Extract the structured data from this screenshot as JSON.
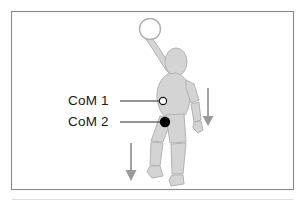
{
  "figure": {
    "background_color": "#ffffff",
    "border_color": "#8a8a8a",
    "body_fill": "#d4d4d4",
    "body_stroke": "#b3b3b3",
    "arrow_color": "#9a9a9a",
    "leader_line_color": "#2b2b2b",
    "marker_open_fill": "#ffffff",
    "marker_open_stroke": "#1a1a1a",
    "marker_filled_fill": "#000000"
  },
  "labels": [
    {
      "id": "com-1",
      "text": "CoM 1",
      "marker_style": "open-circle",
      "marker_x": 163,
      "marker_y": 101
    },
    {
      "id": "com-2",
      "text": "CoM 2",
      "marker_style": "filled-circle",
      "marker_x": 165,
      "marker_y": 122
    }
  ],
  "arrows": [
    {
      "id": "arrow-right",
      "direction": "down",
      "x": 208,
      "y_start": 88,
      "y_end": 126
    },
    {
      "id": "arrow-left",
      "direction": "down",
      "x": 131,
      "y_start": 143,
      "y_end": 182
    }
  ],
  "figure_parts": {
    "ball": "ball-open-circle",
    "head": "head-oval",
    "torso": "torso",
    "raised_arm": "raised-arm",
    "lowered_arm": "lowered-arm",
    "front_leg": "front-leg",
    "back_leg": "back-leg"
  }
}
